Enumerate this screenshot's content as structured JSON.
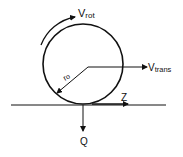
{
  "diagram": {
    "labels": {
      "v_rot": "V",
      "v_rot_sub": "rot",
      "v_trans": "V",
      "v_trans_sub": "trans",
      "radius": "r",
      "radius_sub": "o",
      "friction": "Z",
      "load": "Q"
    },
    "colors": {
      "stroke": "#111111",
      "background": "#ffffff"
    }
  }
}
